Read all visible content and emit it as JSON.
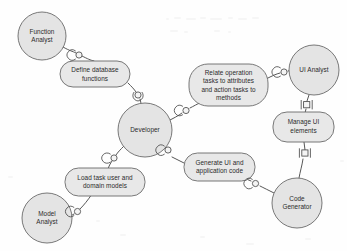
{
  "diagram": {
    "type": "uml-collaboration-diagram",
    "canvas": {
      "width": 347,
      "height": 251,
      "background": "#fefefe"
    },
    "palette": {
      "role_fill": "#e4e4e4",
      "task_fill": "#e8e8e8",
      "shape_stroke": "#6a6a6a",
      "edge_stroke": "#575757",
      "label_color": "#2b2b2b"
    },
    "roles": [
      {
        "id": "function-analyst",
        "label": "Function Analyst",
        "lines": [
          "Function",
          "Analyst"
        ],
        "shape": "circle",
        "cx": 42,
        "cy": 36,
        "r": 24
      },
      {
        "id": "developer",
        "label": "Developer",
        "lines": [
          "Developer"
        ],
        "shape": "circle",
        "cx": 145,
        "cy": 130,
        "r": 27
      },
      {
        "id": "ui-analyst",
        "label": "UI Analyst",
        "lines": [
          "UI Analyst"
        ],
        "shape": "circle",
        "cx": 314,
        "cy": 70,
        "r": 25
      },
      {
        "id": "model-analyst",
        "label": "Model Analyst",
        "lines": [
          "Model",
          "Analyst"
        ],
        "shape": "circle",
        "cx": 47,
        "cy": 218,
        "r": 25
      },
      {
        "id": "code-generator",
        "label": "Code Generator",
        "lines": [
          "Code",
          "Generator"
        ],
        "shape": "circle",
        "cx": 297,
        "cy": 203,
        "r": 25
      }
    ],
    "tasks": [
      {
        "id": "define-database-functions",
        "label": "Define database functions",
        "lines": [
          "Define database",
          "functions"
        ],
        "shape": "rounded-rect",
        "x": 60,
        "y": 61,
        "width": 70,
        "height": 26
      },
      {
        "id": "relate-operation-tasks",
        "label": "Relate operation tasks to attributes and action tasks to methods",
        "lines": [
          "Relate operation",
          "tasks to attributes",
          "and action tasks to",
          "methods"
        ],
        "shape": "rounded-rect",
        "x": 189,
        "y": 64,
        "width": 79,
        "height": 42
      },
      {
        "id": "manage-ui-elements",
        "label": "Manage UI elements",
        "lines": [
          "Manage UI",
          "elements"
        ],
        "shape": "rounded-rect",
        "x": 273,
        "y": 112,
        "width": 61,
        "height": 30
      },
      {
        "id": "generate-ui-and-application-code",
        "label": "Generate UI and application code",
        "lines": [
          "Generate UI and",
          "application code"
        ],
        "shape": "rounded-rect",
        "x": 184,
        "y": 153,
        "width": 71,
        "height": 28
      },
      {
        "id": "load-task-user-and-domain-models",
        "label": "Load task user and domain models",
        "lines": [
          "Load task user and",
          "domain models"
        ],
        "shape": "rounded-rect",
        "x": 65,
        "y": 168,
        "width": 80,
        "height": 28
      }
    ],
    "connections": [
      {
        "id": "function-analyst--define-database-functions",
        "from": "function-analyst",
        "to": "define-database-functions",
        "connector": "assembly",
        "joint": "ball-socket"
      },
      {
        "id": "define-database-functions--developer",
        "from": "define-database-functions",
        "to": "developer",
        "connector": "assembly",
        "joint": "ball-socket"
      },
      {
        "id": "developer--relate-operation-tasks",
        "from": "developer",
        "to": "relate-operation-tasks",
        "connector": "assembly",
        "joint": "ball-socket"
      },
      {
        "id": "relate-operation-tasks--ui-analyst",
        "from": "relate-operation-tasks",
        "to": "ui-analyst",
        "connector": "assembly",
        "joint": "ball-socket"
      },
      {
        "id": "ui-analyst--manage-ui-elements",
        "from": "ui-analyst",
        "to": "manage-ui-elements",
        "connector": "assembly",
        "joint": "square"
      },
      {
        "id": "manage-ui-elements--code-generator",
        "from": "manage-ui-elements",
        "to": "code-generator",
        "connector": "assembly",
        "joint": "square"
      },
      {
        "id": "code-generator--generate-ui-and-application-code",
        "from": "code-generator",
        "to": "generate-ui-and-application-code",
        "connector": "assembly",
        "joint": "ball-socket"
      },
      {
        "id": "generate-ui-and-application-code--developer",
        "from": "generate-ui-and-application-code",
        "to": "developer",
        "connector": "assembly",
        "joint": "ball-socket"
      },
      {
        "id": "developer--load-task-user-and-domain-models",
        "from": "developer",
        "to": "load-task-user-and-domain-models",
        "connector": "assembly",
        "joint": "ball-socket"
      },
      {
        "id": "load-task-user-and-domain-models--model-analyst",
        "from": "load-task-user-and-domain-models",
        "to": "model-analyst",
        "connector": "assembly",
        "joint": "ball-socket"
      }
    ]
  }
}
